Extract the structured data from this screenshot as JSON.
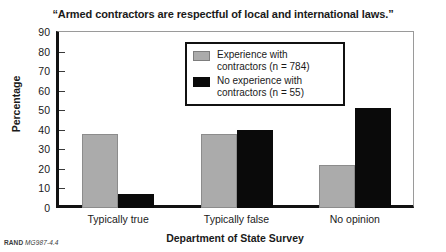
{
  "chart_data": {
    "type": "bar",
    "title": "“Armed contractors are respectful of local and international laws.”",
    "xlabel": "Department of State Survey",
    "ylabel": "Percentage",
    "categories": [
      "Typically true",
      "Typically false",
      "No opinion"
    ],
    "ylim": [
      0,
      90
    ],
    "yticks": [
      0,
      10,
      20,
      30,
      40,
      50,
      60,
      70,
      80,
      90
    ],
    "grid": false,
    "legend_position": "top-center-inside",
    "series": [
      {
        "name": "Experience with\ncontractors (n = 784)",
        "color": "#ababab",
        "values": [
          38,
          38,
          22
        ]
      },
      {
        "name": "No experience with\ncontractors (n = 55)",
        "color": "#0a0a0a",
        "values": [
          7,
          40,
          51
        ]
      }
    ]
  },
  "footer": {
    "brand": "RAND",
    "code": "MG987-4.4"
  }
}
